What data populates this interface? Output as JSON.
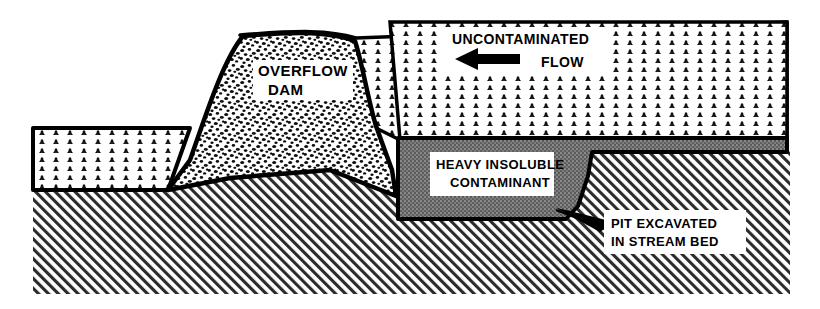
{
  "diagram": {
    "type": "engineering-cross-section",
    "width": 820,
    "height": 309,
    "background_color": "#ffffff"
  },
  "labels": {
    "overflow_dam": {
      "line1": "OVERFLOW",
      "line2": "DAM"
    },
    "uncontaminated_flow": {
      "line1": "UNCONTAMINATED",
      "line2": "FLOW"
    },
    "contaminant": {
      "line1": "HEAVY INSOLUBLE",
      "line2": "CONTAMINANT"
    },
    "pit": {
      "line1": "PIT EXCAVATED",
      "line2": "IN STREAM BED"
    }
  },
  "layers": [
    {
      "name": "water",
      "display_name": "Uncontaminated flow water",
      "pattern": "fish-scale",
      "fill_color": "#ffffff",
      "stroke_color": "#000000"
    },
    {
      "name": "overflow-dam",
      "display_name": "Overflow dam",
      "pattern": "stipple-coarse",
      "fill_color": "#ffffff",
      "stroke_color": "#000000"
    },
    {
      "name": "contaminant",
      "display_name": "Heavy insoluble contaminant",
      "pattern": "dense-gray",
      "fill_color": "#6e6e6e",
      "stroke_color": "#000000"
    },
    {
      "name": "ground",
      "display_name": "Stream bed ground",
      "pattern": "diagonal-hatch",
      "fill_color": "#ffffff",
      "stroke_color": "#000000"
    }
  ],
  "arrow": {
    "name": "flow-direction-arrow",
    "direction": "left",
    "color": "#000000"
  },
  "colors": {
    "outline": "#000000",
    "contaminant_gray": "#6e6e6e",
    "hatch_gray": "#444444",
    "paper": "#ffffff"
  }
}
